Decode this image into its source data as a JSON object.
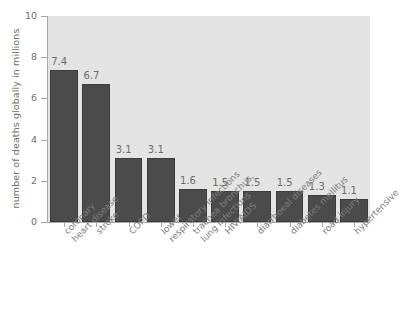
{
  "chart_data": {
    "type": "bar",
    "title": "",
    "xlabel": "",
    "ylabel": "number of deaths globally in millions",
    "ylim": [
      0,
      10
    ],
    "yticks": [
      0,
      2,
      4,
      6,
      8,
      10
    ],
    "ytick_labels": [
      "0",
      "2",
      "4",
      "6",
      "8",
      "10"
    ],
    "grid": false,
    "legend": false,
    "bar_color": "#4b4b4b",
    "plot_background": "#e4e4e4",
    "axis_color": "#a8a8a8",
    "text_color": "#7d7d7d",
    "categories": [
      "coronary heart disease",
      "stroke",
      "COPD",
      "lower respiratory infections",
      "trachea bronchus, lung infections",
      "HIV/AIDS",
      "diarrhoeal diseases",
      "diabetes mellitus",
      "road injury",
      "hypertensive"
    ],
    "category_lines": [
      [
        "coronary",
        "heart disease"
      ],
      [
        "stroke"
      ],
      [
        "COPD"
      ],
      [
        "lower",
        "respiratory infections"
      ],
      [
        "trachea bronchus,",
        "lung infections"
      ],
      [
        "HIV/AIDS"
      ],
      [
        "diarrhoeal diseases"
      ],
      [
        "diabetes mellitus"
      ],
      [
        "road injury"
      ],
      [
        "hypertensive"
      ]
    ],
    "values": [
      7.4,
      6.7,
      3.1,
      3.1,
      1.6,
      1.5,
      1.5,
      1.5,
      1.3,
      1.1
    ],
    "value_labels": [
      "7.4",
      "6.7",
      "3.1",
      "3.1",
      "1.6",
      "1.5",
      "1.5",
      "1.5",
      "1.3",
      "1.1"
    ]
  }
}
